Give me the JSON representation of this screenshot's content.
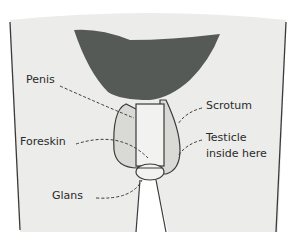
{
  "diagram": {
    "type": "labeled anatomical illustration",
    "colors": {
      "background": "#ffffff",
      "skin": "#ececea",
      "hair": "#555a57",
      "scrotum": "#d9d9d6",
      "outline": "#3a3a3a"
    },
    "labels": {
      "penis": "Penis",
      "foreskin": "Foreskin",
      "glans": "Glans",
      "scrotum": "Scrotum",
      "testicle_line1": "Testicle",
      "testicle_line2": "inside here"
    }
  }
}
